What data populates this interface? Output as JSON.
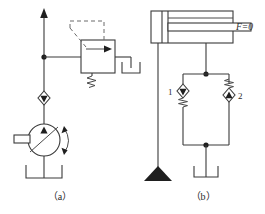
{
  "figure": {
    "type": "hydraulic-schematic",
    "background_color": "#ffffff",
    "line_color": "#3a3a3a"
  },
  "captions": {
    "left": "（a）",
    "right": "（b）"
  },
  "labels": {
    "force": "F=0",
    "valve_one": "1",
    "valve_two": "2"
  },
  "circuit_a": {
    "name": "pressure-relief-pump-circuit",
    "components": [
      {
        "id": "flow-arrow-up",
        "name": "supply-line-arrow",
        "symbol": "arrow-up"
      },
      {
        "id": "junction",
        "name": "line-junction-dot",
        "symbol": "junction-dot"
      },
      {
        "id": "relief-valve",
        "name": "pilot-operated-relief-valve",
        "symbol": "relief-valve-box"
      },
      {
        "id": "relief-spring",
        "name": "relief-valve-spring",
        "symbol": "spring"
      },
      {
        "id": "pilot-line",
        "name": "pilot-drain-line",
        "symbol": "dashed-line"
      },
      {
        "id": "tank-a",
        "name": "reservoir-tank",
        "symbol": "tank-u"
      },
      {
        "id": "check-valve-a",
        "name": "check-valve",
        "symbol": "diamond-check"
      },
      {
        "id": "pump",
        "name": "variable-displacement-pump",
        "symbol": "circle-pump"
      },
      {
        "id": "pump-tank",
        "name": "pump-reservoir-tank",
        "symbol": "tank-u"
      }
    ]
  },
  "circuit_b": {
    "name": "double-rod-cylinder-circuit",
    "components": [
      {
        "id": "cylinder",
        "name": "double-rod-hydraulic-cylinder",
        "symbol": "cylinder"
      },
      {
        "id": "piston-rod",
        "name": "piston-rod",
        "symbol": "rod"
      },
      {
        "id": "b-junction-top",
        "name": "line-junction-dot",
        "symbol": "junction-dot"
      },
      {
        "id": "valve-1",
        "name": "check-valve-one",
        "symbol": "diamond-check-spring-below"
      },
      {
        "id": "valve-2",
        "name": "check-valve-two",
        "symbol": "diamond-check-spring-above"
      },
      {
        "id": "b-junction-bottom",
        "name": "line-junction-dot",
        "symbol": "junction-dot"
      },
      {
        "id": "tank-b",
        "name": "reservoir-tank",
        "symbol": "tank-u"
      },
      {
        "id": "drain-triangle",
        "name": "drain-triangle",
        "symbol": "filled-triangle"
      }
    ]
  }
}
